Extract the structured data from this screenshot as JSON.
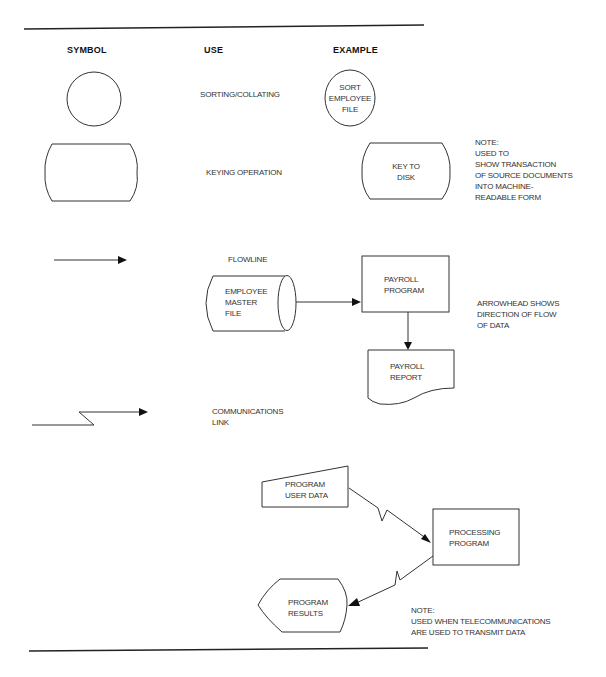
{
  "headers": {
    "symbol": "SYMBOL",
    "use": "USE",
    "example": "EXAMPLE"
  },
  "rows": {
    "sorting": {
      "use": "SORTING/COLLATING",
      "example": "SORT\nEMPLOYEE\nFILE",
      "symbol_shape": "circle"
    },
    "keying": {
      "use": "KEYING OPERATION",
      "example": "KEY TO\nDISK",
      "note": "NOTE:\nUSED TO\nSHOW TRANSACTION\nOF SOURCE DOCUMENTS\nINTO MACHINE-\nREADABLE FORM",
      "symbol_shape": "rounded-barrel-rectangle"
    },
    "flowline": {
      "use": "FLOWLINE",
      "symbol_shape": "arrow",
      "example_nodes": {
        "master_file": "EMPLOYEE\nMASTER\nFILE",
        "payroll_program": "PAYROLL\nPROGRAM",
        "payroll_report": "PAYROLL\nREPORT"
      },
      "note": "ARROWHEAD SHOWS\nDIRECTION OF FLOW\nOF DATA"
    },
    "communications": {
      "use": "COMMUNICATIONS\nLINK",
      "symbol_shape": "lightning-arrow",
      "example_nodes": {
        "user_data": "PROGRAM\nUSER DATA",
        "processing_program": "PROCESSING\nPROGRAM",
        "results": "PROGRAM\nRESULTS"
      },
      "note": "NOTE:\nUSED WHEN TELECOMMUNICATIONS\nARE USED TO TRANSMIT DATA"
    }
  },
  "colors": {
    "ink": "#222222",
    "background": "#ffffff"
  }
}
